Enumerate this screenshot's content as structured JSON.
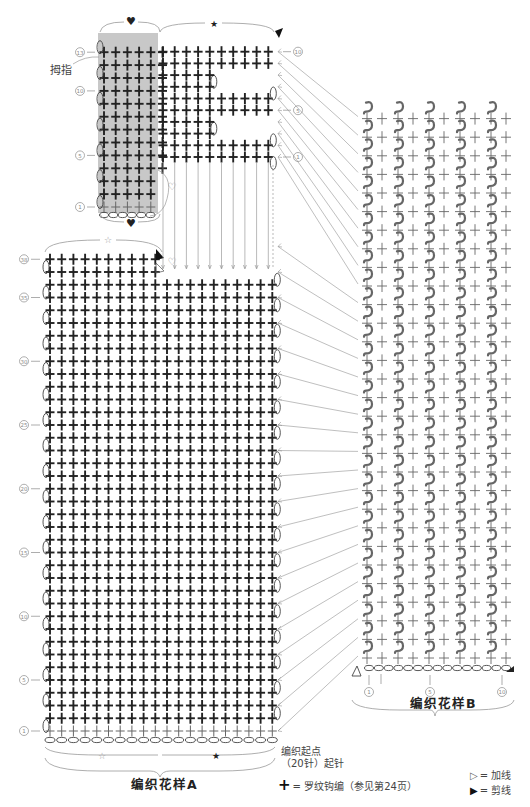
{
  "labels": {
    "thumb": "拇指",
    "start_point_line1": "编织起点",
    "start_point_line2": "（20针）起针",
    "pattern_a_title": "编织花样A",
    "pattern_b_title": "编织花样B"
  },
  "markers": {
    "heart": "♥",
    "star_outline": "☆",
    "star_filled": "★"
  },
  "legend": [
    {
      "symbol": "+",
      "icon": "single-crochet-rib-icon",
      "text": "= 罗纹钩编（参见第24页）"
    },
    {
      "symbol": "▷",
      "icon": "join-yarn-icon",
      "text": "= 加线"
    },
    {
      "symbol": "▶",
      "icon": "cut-yarn-icon",
      "text": "= 剪线"
    }
  ],
  "colors": {
    "grid_stitch": "#222222",
    "light_stitch": "#666666",
    "thumb_shade": "#c8c8c8",
    "guide_lines": "#8a8a8a",
    "label_circle": "#999999"
  },
  "pattern_a": {
    "stitches_wide": 20,
    "rows": 38,
    "row_labels": [
      "1",
      "5",
      "10",
      "15",
      "20",
      "25",
      "30",
      "35",
      "38"
    ],
    "top_partial_rows": 2,
    "top_partial_stitches": 10
  },
  "thumb_section": {
    "stitches_wide": 6,
    "rows": 13,
    "row_labels": [
      "1",
      "5",
      "10",
      "13"
    ]
  },
  "top_section": {
    "stitches_wide": 10,
    "rows": 10,
    "row_labels": [
      "1",
      "5",
      "10"
    ]
  },
  "pattern_b": {
    "repeats": 5,
    "rows": 30,
    "bottom_labels": [
      "1",
      "5",
      "10"
    ]
  }
}
